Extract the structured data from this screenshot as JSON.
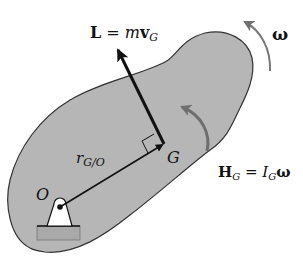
{
  "diagram": {
    "colors": {
      "body_fill": "#b4b4b4",
      "body_stroke": "#333333",
      "vector": "#111111",
      "rotation_arrow": "#707070",
      "support_fill": "#ffffff",
      "ground_fill": "#a8a8a8"
    },
    "labels": {
      "linear_momentum": {
        "bold_symbol": "L",
        "equals": " = ",
        "mass": "m",
        "velocity": "v",
        "velocity_sub": "G"
      },
      "angular_velocity": "ω",
      "angular_momentum": {
        "bold_symbol": "H",
        "bold_sub": "G",
        "equals": " = ",
        "inertia": "I",
        "inertia_sub": "G",
        "omega": "ω"
      },
      "position_vector": {
        "symbol": "r",
        "sub": "G/O"
      },
      "center_of_mass": "G",
      "pivot": "O"
    }
  }
}
